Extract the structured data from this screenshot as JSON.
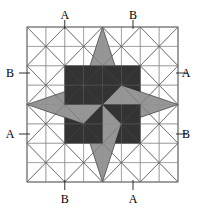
{
  "figure": {
    "width": 206,
    "height": 214,
    "background_color": "#ffffff"
  },
  "grid": {
    "columns": 8,
    "rows": 8,
    "x0": 27,
    "y0": 27,
    "x1": 178,
    "y1": 182,
    "cell_width": 18.875,
    "cell_height": 19.375,
    "line_color": "#8a8a8a",
    "line_width": 0.7,
    "diagonals": {
      "block_size_cells": 2,
      "pattern": "X in each 2x2 block",
      "line_color": "#555555",
      "line_width": 0.7
    }
  },
  "star": {
    "center_x": 102.5,
    "center_y": 104.5,
    "points": 8,
    "dark_color": "#333333",
    "light_color": "#969696",
    "outline_color": "#222222",
    "outline_width": 0.6,
    "kites": [
      {
        "name": "north",
        "fill": "light",
        "tip_x": 102.5,
        "tip_y": 27
      },
      {
        "name": "northeast",
        "fill": "dark",
        "tip_x": 140.25,
        "tip_y": 65.75
      },
      {
        "name": "east",
        "fill": "light",
        "tip_x": 178,
        "tip_y": 104.5
      },
      {
        "name": "southeast",
        "fill": "dark",
        "tip_x": 140.25,
        "tip_y": 143.25
      },
      {
        "name": "south",
        "fill": "light",
        "tip_x": 102.5,
        "tip_y": 182
      },
      {
        "name": "southwest",
        "fill": "dark",
        "tip_x": 64.75,
        "tip_y": 143.25
      },
      {
        "name": "west",
        "fill": "light",
        "tip_x": 27,
        "tip_y": 104.5
      },
      {
        "name": "northwest",
        "fill": "dark",
        "tip_x": 64.75,
        "tip_y": 65.75
      }
    ]
  },
  "labels": [
    {
      "id": "label-top-a",
      "text": "A",
      "x": 64.75,
      "y": 9,
      "anchor": "top",
      "tick_x": 64.75,
      "tick_y0": 20,
      "tick_x1": 64.75,
      "tick_y1": 29
    },
    {
      "id": "label-top-b",
      "text": "B",
      "x": 133.0,
      "y": 9,
      "anchor": "top",
      "tick_x": 133.0,
      "tick_y0": 20,
      "tick_x1": 133.0,
      "tick_y1": 29
    },
    {
      "id": "label-left-b",
      "text": "B",
      "x": 10,
      "y": 67,
      "anchor": "left",
      "tick_x": 19,
      "tick_y0": 73,
      "tick_x1": 30,
      "tick_y1": 73
    },
    {
      "id": "label-left-a",
      "text": "A",
      "x": 10,
      "y": 128,
      "anchor": "left",
      "tick_x": 19,
      "tick_y0": 134,
      "tick_x1": 30,
      "tick_y1": 134
    },
    {
      "id": "label-right-a",
      "text": "A",
      "x": 186,
      "y": 67,
      "anchor": "right",
      "tick_x": 176,
      "tick_y0": 73,
      "tick_x1": 187,
      "tick_y1": 73
    },
    {
      "id": "label-right-b",
      "text": "B",
      "x": 186,
      "y": 128,
      "anchor": "right",
      "tick_x": 176,
      "tick_y0": 134,
      "tick_x1": 187,
      "tick_y1": 134
    },
    {
      "id": "label-bottom-b",
      "text": "B",
      "x": 64.75,
      "y": 193,
      "anchor": "bottom",
      "tick_x": 64.75,
      "tick_y0": 180,
      "tick_x1": 64.75,
      "tick_y1": 190
    },
    {
      "id": "label-bottom-a",
      "text": "A",
      "x": 133.0,
      "y": 193,
      "anchor": "bottom",
      "tick_x": 133.0,
      "tick_y0": 180,
      "tick_x1": 133.0,
      "tick_y1": 190
    }
  ]
}
